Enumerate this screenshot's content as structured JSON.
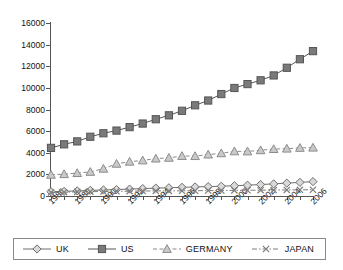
{
  "chart_data": {
    "type": "line",
    "title": "",
    "subtitle": "",
    "xlabel": "",
    "ylabel": "",
    "xlim": [
      1986,
      2006
    ],
    "ylim": [
      0,
      16000
    ],
    "grid": false,
    "legend_position": "bottom",
    "x": [
      1986,
      1987,
      1988,
      1989,
      1990,
      1991,
      1992,
      1993,
      1994,
      1995,
      1996,
      1997,
      1998,
      1999,
      2000,
      2001,
      2002,
      2003,
      2004,
      2005,
      2006
    ],
    "x_tick_labels": [
      "1986",
      "1988",
      "1990",
      "1992",
      "1994",
      "1996",
      "1998",
      "2000",
      "2002",
      "2004",
      "2006"
    ],
    "y_tick_labels": [
      "0",
      "2000",
      "4000",
      "6000",
      "8000",
      "10000",
      "12000",
      "14000",
      "16000"
    ],
    "y_ticks": [
      0,
      2000,
      4000,
      6000,
      8000,
      10000,
      12000,
      14000,
      16000
    ],
    "series": [
      {
        "name": "UK",
        "marker": "diamond",
        "line_style": "solid",
        "color": "#6e6e6e",
        "fill": "#d9d9d9",
        "values": [
          400,
          430,
          470,
          520,
          560,
          600,
          640,
          690,
          730,
          760,
          800,
          840,
          870,
          900,
          950,
          1000,
          1060,
          1120,
          1190,
          1260,
          1330
        ]
      },
      {
        "name": "US",
        "marker": "square",
        "line_style": "solid",
        "color": "#555555",
        "fill": "#7a7a7a",
        "values": [
          4450,
          4780,
          5050,
          5480,
          5800,
          6050,
          6370,
          6700,
          7100,
          7460,
          7880,
          8390,
          8830,
          9430,
          9990,
          10350,
          10700,
          11150,
          11860,
          12650,
          13400
        ]
      },
      {
        "name": "GERMANY",
        "marker": "triangle",
        "line_style": "dashed",
        "color": "#8c8c8c",
        "fill": "#c9c9c9",
        "values": [
          1960,
          2020,
          2120,
          2230,
          2520,
          2980,
          3170,
          3290,
          3460,
          3530,
          3700,
          3690,
          3830,
          3950,
          4130,
          4120,
          4230,
          4340,
          4380,
          4450,
          4470
        ]
      },
      {
        "name": "JAPAN",
        "marker": "x",
        "line_style": "dashdot",
        "color": "#7d7d7d",
        "fill": "none",
        "values": [
          330,
          350,
          380,
          400,
          420,
          430,
          450,
          460,
          470,
          470,
          480,
          490,
          500,
          510,
          520,
          530,
          540,
          550,
          560,
          570,
          580
        ]
      }
    ]
  },
  "legend": {
    "items": [
      {
        "label": "UK"
      },
      {
        "label": "US"
      },
      {
        "label": "GERMANY"
      },
      {
        "label": "JAPAN"
      }
    ]
  }
}
